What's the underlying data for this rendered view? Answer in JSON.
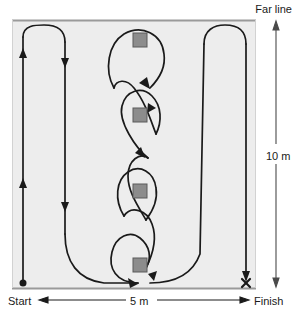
{
  "diagram": {
    "labels": {
      "far_line": "Far line",
      "start": "Start",
      "finish": "Finish",
      "width_dimension": "5 m",
      "height_dimension": "10 m"
    },
    "markers": {
      "start_marker": "filled-dot",
      "finish_marker": "x-cross"
    },
    "cones": [
      {
        "name": "cone-1",
        "x": 133,
        "y": 33,
        "size": 14
      },
      {
        "name": "cone-2",
        "x": 133,
        "y": 108,
        "size": 14
      },
      {
        "name": "cone-3",
        "x": 133,
        "y": 184,
        "size": 14
      },
      {
        "name": "cone-4",
        "x": 133,
        "y": 258,
        "size": 14
      }
    ],
    "colors": {
      "field_fill": "#ededed",
      "field_border": "#9a9a9a",
      "path_stroke": "#1a1a1a",
      "cone_fill": "#8c8c8c",
      "cone_border": "#5a5a5a",
      "dimension_stroke": "#4a4a4a",
      "text": "#1a1a1a"
    },
    "geometry": {
      "field_left": 12,
      "field_top": 20,
      "field_right": 256,
      "field_bottom": 288
    }
  }
}
